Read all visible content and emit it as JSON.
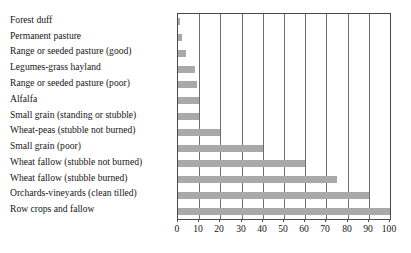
{
  "chart_data": {
    "type": "bar",
    "orientation": "horizontal",
    "title": "",
    "subtitle": "",
    "xlabel": "",
    "ylabel": "",
    "xlim": [
      0,
      100
    ],
    "ylim": null,
    "grid": true,
    "grid_axis": "x",
    "legend": false,
    "legend_position": "none",
    "bar_color": "#a9a9a9",
    "frame_color": "#4a4a4a",
    "xticks": [
      0,
      10,
      20,
      30,
      40,
      50,
      60,
      70,
      80,
      90,
      100
    ],
    "xtick_labels": [
      "0",
      "10",
      "20",
      "30",
      "40",
      "50",
      "60",
      "70",
      "80",
      "90",
      "100"
    ],
    "categories": [
      "Forest duff",
      "Permanent pasture",
      "Range or seeded pasture (good)",
      "Legumes-grass hayland",
      "Range or seeded pasture (poor)",
      "Alfalfa",
      "Small grain (standing or stubble)",
      "Wheat-peas (stubble not burned)",
      "Small grain (poor)",
      "Wheat fallow (stubble not burned)",
      "Wheat fallow (stubble burned)",
      "Orchards-vineyards (clean tilled)",
      "Row crops and fallow"
    ],
    "values": [
      1,
      2,
      4,
      8,
      9,
      10,
      10,
      20,
      40,
      60,
      75,
      90,
      100
    ]
  }
}
